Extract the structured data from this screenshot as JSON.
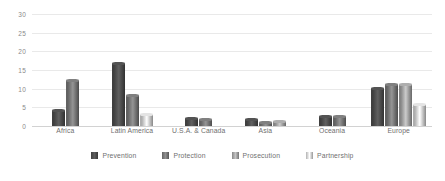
{
  "chart_data": {
    "type": "bar",
    "title": "",
    "subtitle": "",
    "xlabel": "",
    "ylabel": "",
    "ylim": [
      0,
      30
    ],
    "yticks": [
      0,
      5,
      10,
      15,
      20,
      25,
      30
    ],
    "grid": true,
    "legend_position": "bottom",
    "categories": [
      "Africa",
      "Latin America",
      "U.S.A. & Canada",
      "Asia",
      "Oceania",
      "Europe"
    ],
    "series": [
      {
        "name": "Prevention",
        "color": "#4f4f4f",
        "values": [
          4,
          16.5,
          2,
          1.5,
          2.5,
          10
        ]
      },
      {
        "name": "Protection",
        "color": "#7a7a7a",
        "values": [
          12,
          8,
          1.5,
          0.8,
          2.5,
          11
        ]
      },
      {
        "name": "Prosecution",
        "color": "#a6a6a6",
        "values": [
          0,
          0,
          0,
          1,
          0,
          11
        ]
      },
      {
        "name": "Partnership",
        "color": "#d9d9d9",
        "values": [
          0,
          3,
          0,
          0,
          0,
          5.5
        ]
      }
    ]
  },
  "legend": {
    "items": [
      {
        "label": "Prevention",
        "color": "#4f4f4f",
        "swatch": "legend-swatch-prevention"
      },
      {
        "label": "Protection",
        "color": "#7a7a7a",
        "swatch": "legend-swatch-protection"
      },
      {
        "label": "Prosecution",
        "color": "#a6a6a6",
        "swatch": "legend-swatch-prosecution"
      },
      {
        "label": "Partnership",
        "color": "#d9d9d9",
        "swatch": "legend-swatch-partnership"
      }
    ]
  },
  "axis": {
    "y_tick_labels": [
      "30",
      "25",
      "20",
      "15",
      "10",
      "5",
      "0"
    ]
  },
  "colors": {
    "gridline": "#e9e9e9",
    "baseline": "#d2d2d2",
    "text": "#6f6f6f",
    "tick_text": "#8a8a8a",
    "background": "#ffffff"
  }
}
